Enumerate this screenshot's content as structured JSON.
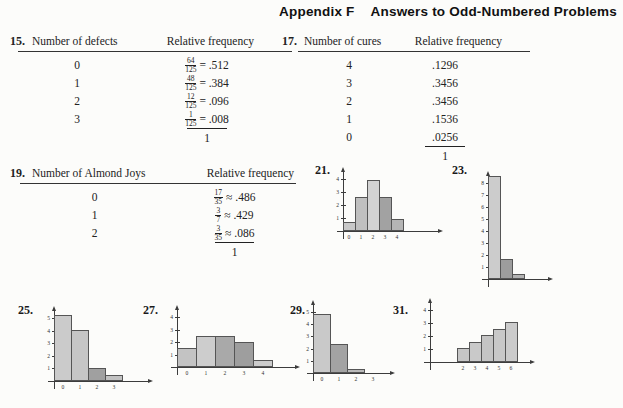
{
  "header": {
    "appendix": "Appendix F",
    "title": "Answers to Odd-Numbered Problems"
  },
  "tables": {
    "p15": {
      "number": "15.",
      "col1": "Number of defects",
      "col2": "Relative frequency",
      "rows": [
        {
          "x": "0",
          "num": "64",
          "den": "125",
          "eq": "=",
          "val": ".512"
        },
        {
          "x": "1",
          "num": "48",
          "den": "125",
          "eq": "=",
          "val": ".384"
        },
        {
          "x": "2",
          "num": "12",
          "den": "125",
          "eq": "=",
          "val": ".096"
        },
        {
          "x": "3",
          "num": "1",
          "den": "125",
          "eq": "=",
          "val": ".008"
        }
      ],
      "total": "1"
    },
    "p17": {
      "number": "17.",
      "col1": "Number of cures",
      "col2": "Relative frequency",
      "rows": [
        {
          "x": "4",
          "val": ".1296"
        },
        {
          "x": "3",
          "val": ".3456"
        },
        {
          "x": "2",
          "val": ".3456"
        },
        {
          "x": "1",
          "val": ".1536"
        },
        {
          "x": "0",
          "val": ".0256"
        }
      ],
      "total": "1"
    },
    "p19": {
      "number": "19.",
      "col1": "Number of Almond Joys",
      "col2": "Relative frequency",
      "rows": [
        {
          "x": "0",
          "num": "17",
          "den": "35",
          "eq": "≈",
          "val": ".486"
        },
        {
          "x": "1",
          "num": "3",
          "den": "7",
          "eq": "≈",
          "val": ".429"
        },
        {
          "x": "2",
          "num": "3",
          "den": "35",
          "eq": "≈",
          "val": ".086"
        }
      ],
      "total": "1"
    }
  },
  "chart_data": [
    {
      "id": "21",
      "label": "21.",
      "type": "bar",
      "categories": [
        "0",
        "1",
        "2",
        "3",
        "4"
      ],
      "values": [
        0.7,
        2.6,
        3.9,
        2.6,
        0.9
      ],
      "bar_colors": [
        "#c8c8c8",
        "#c0c0c0",
        "#d3d3d3",
        "#a2a2a2",
        "#b5b5b5"
      ],
      "y_ticks": [
        "1",
        "2",
        "3",
        "4"
      ],
      "ylim": [
        0,
        4.7
      ],
      "grid": false,
      "pos": {
        "left": 313,
        "top": 161,
        "width": 145,
        "height": 96,
        "origin_x": 30,
        "origin_y": 70,
        "tick_px": 13,
        "bar_px": 12,
        "bar_offset": 0,
        "x_len": 95
      }
    },
    {
      "id": "23",
      "label": "23.",
      "type": "bar",
      "categories": [],
      "values": [
        8.55,
        1.7,
        0.45
      ],
      "bar_colors": [
        "#cccccc",
        "#9d9d9d",
        "#b3b3b3"
      ],
      "y_ticks": [
        "1",
        "2",
        "3",
        "4",
        "5",
        "6",
        "7",
        "8"
      ],
      "ylim": [
        0,
        9
      ],
      "grid": false,
      "pos": {
        "left": 450,
        "top": 161,
        "width": 130,
        "height": 132,
        "origin_x": 38,
        "origin_y": 118,
        "tick_px": 12,
        "bar_px": 12,
        "bar_offset": 0,
        "x_len": 60
      }
    },
    {
      "id": "25",
      "label": "25.",
      "type": "bar",
      "categories": [
        "0",
        "1",
        "2",
        "3"
      ],
      "values": [
        5.2,
        4.05,
        1.0,
        0.45
      ],
      "bar_colors": [
        "#cbcbcb",
        "#c6c6c6",
        "#a0a0a0",
        "#c2c2c2"
      ],
      "y_ticks": [
        "1",
        "2",
        "3",
        "4",
        "5"
      ],
      "ylim": [
        0,
        5.7
      ],
      "grid": false,
      "pos": {
        "left": 16,
        "top": 301,
        "width": 140,
        "height": 102,
        "origin_x": 38,
        "origin_y": 80,
        "tick_px": 12.6,
        "bar_px": 17,
        "bar_offset": 0,
        "x_len": 94
      }
    },
    {
      "id": "27",
      "label": "27.",
      "type": "bar",
      "categories": [
        "0",
        "1",
        "2",
        "3",
        "4"
      ],
      "values": [
        1.5,
        2.5,
        2.5,
        2.0,
        0.55
      ],
      "bar_colors": [
        "#c3c3c3",
        "#cdcdcd",
        "#a9a9a9",
        "#9e9e9e",
        "#cccccc"
      ],
      "y_ticks": [
        "1",
        "2",
        "3",
        "4"
      ],
      "ylim": [
        0,
        4.6
      ],
      "grid": false,
      "pos": {
        "left": 141,
        "top": 301,
        "width": 168,
        "height": 100,
        "origin_x": 36,
        "origin_y": 66,
        "tick_px": 12.5,
        "bar_px": 19,
        "bar_offset": 0,
        "x_len": 118
      }
    },
    {
      "id": "29",
      "label": "29.",
      "type": "bar",
      "categories": [
        "0",
        "1",
        "2",
        "3"
      ],
      "values": [
        4.85,
        2.4,
        0.3
      ],
      "bar_colors": [
        "#c9c9c9",
        "#a3a3a3",
        "#bababa"
      ],
      "y_ticks": [
        "1",
        "2",
        "3",
        "4",
        "5"
      ],
      "ylim": [
        0,
        5.6
      ],
      "grid": false,
      "pos": {
        "left": 288,
        "top": 301,
        "width": 125,
        "height": 106,
        "origin_x": 25,
        "origin_y": 72,
        "tick_px": 12.2,
        "bar_px": 17,
        "bar_offset": 0,
        "x_len": 77
      }
    },
    {
      "id": "31",
      "label": "31.",
      "type": "bar",
      "categories": [
        "2",
        "3",
        "4",
        "5",
        "6"
      ],
      "values": [
        1.05,
        1.55,
        2.1,
        2.55,
        3.05
      ],
      "bar_colors": [
        "#c6c6c6",
        "#c9c9c9",
        "#c4c4c4",
        "#c8c8c8",
        "#cbcbcb"
      ],
      "y_ticks": [
        "1",
        "2",
        "3",
        "4"
      ],
      "ylim": [
        0,
        4.5
      ],
      "grid": false,
      "pos": {
        "left": 391,
        "top": 301,
        "width": 192,
        "height": 106,
        "origin_x": 39,
        "origin_y": 61,
        "tick_px": 13,
        "bar_px": 12,
        "bar_offset": 27,
        "x_len": 100
      }
    }
  ]
}
